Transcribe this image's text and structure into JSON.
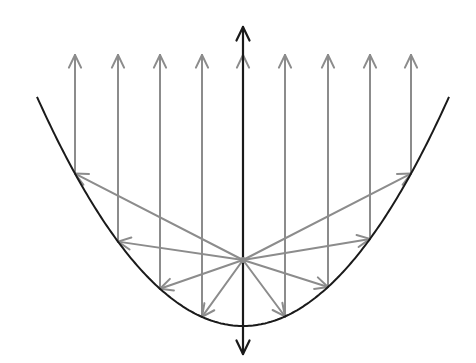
{
  "diagram": {
    "colors": {
      "background": "#ffffff",
      "curve": "#1a1a1a",
      "axis": "#1a1a1a",
      "rays": "#8c8c8c"
    },
    "axis": {
      "x": 243,
      "top": 27,
      "bottom": 354
    },
    "vertex": {
      "x": 243,
      "y": 326
    },
    "focus": {
      "x": 243,
      "y": 260
    },
    "curve": {
      "k": 0.0054,
      "x_start": 37,
      "x_end": 449
    },
    "ray_tip_y": 55,
    "ray_x": [
      75,
      118,
      160,
      202,
      243,
      285,
      328,
      370,
      411
    ]
  }
}
